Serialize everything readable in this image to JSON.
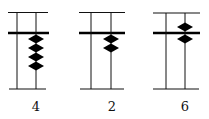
{
  "figure": {
    "colors": {
      "line": "#111111",
      "bead": "#000000",
      "background": "#ffffff"
    },
    "abaci": [
      {
        "label": "4",
        "upper_beads_touching_beam": 0,
        "lower_beads_touching_beam": 4,
        "value": 4
      },
      {
        "label": "2",
        "upper_beads_touching_beam": 0,
        "lower_beads_touching_beam": 2,
        "value": 2
      },
      {
        "label": "6",
        "upper_beads_touching_beam": 1,
        "lower_beads_touching_beam": 1,
        "value": 6
      }
    ]
  }
}
